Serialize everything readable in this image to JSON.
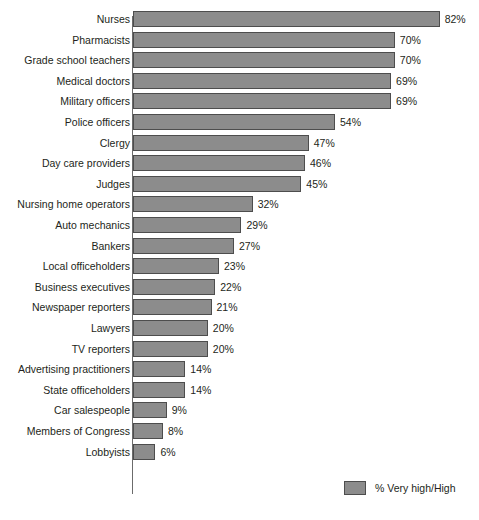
{
  "intro": {
    "text": "these different fields to be honest and ethical."
  },
  "legend": {
    "label": "% Very high/High",
    "swatch_color": "#8c8c8c"
  },
  "chart_data": {
    "type": "bar",
    "orientation": "horizontal",
    "title": "",
    "xlabel": "",
    "ylabel": "",
    "xlim": [
      0,
      100
    ],
    "grid": false,
    "legend_position": "bottom-right",
    "bar_color": "#8c8c8c",
    "bar_border_color": "#4d4d4d",
    "value_suffix": "%",
    "categories": [
      "Nurses",
      "Pharmacists",
      "Grade school teachers",
      "Medical doctors",
      "Military officers",
      "Police officers",
      "Clergy",
      "Day care providers",
      "Judges",
      "Nursing home operators",
      "Auto mechanics",
      "Bankers",
      "Local officeholders",
      "Business executives",
      "Newspaper reporters",
      "Lawyers",
      "TV reporters",
      "Advertising practitioners",
      "State officeholders",
      "Car salespeople",
      "Members of Congress",
      "Lobbyists"
    ],
    "values": [
      82,
      70,
      70,
      69,
      69,
      54,
      47,
      46,
      45,
      32,
      29,
      27,
      23,
      22,
      21,
      20,
      20,
      14,
      14,
      9,
      8,
      6
    ],
    "value_labels": [
      "82%",
      "70%",
      "70%",
      "69%",
      "69%",
      "54%",
      "47%",
      "46%",
      "45%",
      "32%",
      "29%",
      "27%",
      "23%",
      "22%",
      "21%",
      "20%",
      "20%",
      "14%",
      "14%",
      "9%",
      "8%",
      "6%"
    ],
    "series": [
      {
        "name": "% Very high/High",
        "values": [
          82,
          70,
          70,
          69,
          69,
          54,
          47,
          46,
          45,
          32,
          29,
          27,
          23,
          22,
          21,
          20,
          20,
          14,
          14,
          9,
          8,
          6
        ]
      }
    ]
  }
}
